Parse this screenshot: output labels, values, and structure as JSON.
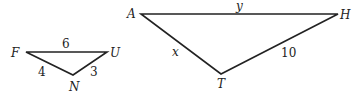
{
  "triangles": [
    {
      "name": "FUN",
      "vertices": {
        "F": {
          "label": "F",
          "x": 26,
          "y": 52
        },
        "U": {
          "label": "U",
          "x": 107,
          "y": 52
        },
        "N": {
          "label": "N",
          "x": 73,
          "y": 75
        }
      },
      "sides": {
        "FU": "6",
        "FN": "4",
        "UN": "3"
      }
    },
    {
      "name": "AHT",
      "vertices": {
        "A": {
          "label": "A",
          "x": 141,
          "y": 14
        },
        "H": {
          "label": "H",
          "x": 338,
          "y": 14
        },
        "T": {
          "label": "T",
          "x": 221,
          "y": 74
        }
      },
      "sides": {
        "AH": "y",
        "AT": "x",
        "HT": "10"
      }
    }
  ],
  "colors": {
    "stroke": "#222222",
    "background": "#ffffff"
  }
}
